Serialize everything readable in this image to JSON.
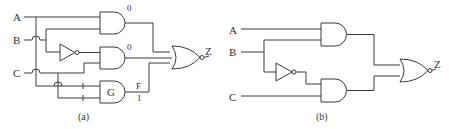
{
  "diagram_a": {
    "caption": "(a)",
    "inputs": {
      "a": "A",
      "b": "B",
      "c": "C"
    },
    "output": "Z",
    "gate_values": {
      "and1": "0",
      "and2": "0",
      "and3_label": "G",
      "and3_out": "F",
      "and3_val": "1"
    }
  },
  "diagram_b": {
    "caption": "(b)",
    "inputs": {
      "a": "A",
      "b": "B",
      "c": "C"
    },
    "output": "Z"
  },
  "colors": {
    "line": "#3a3a3a",
    "background": "#ffffff"
  }
}
